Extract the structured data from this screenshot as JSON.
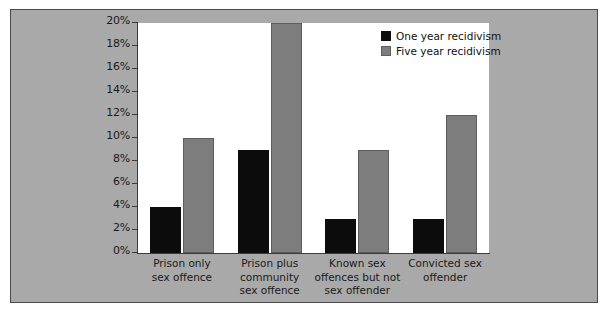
{
  "chart_data": {
    "type": "bar",
    "title": "",
    "xlabel": "",
    "ylabel": "",
    "ylim": [
      0,
      20
    ],
    "grid": false,
    "legend_position": "top-right-inside",
    "categories": [
      "Prison only\nsex offence",
      "Prison plus\ncommunity\nsex offence",
      "Known sex\noffences but not\nsex offender",
      "Convicted sex\noffender"
    ],
    "ytick_labels": [
      "0%",
      "2%",
      "4%",
      "6%",
      "8%",
      "10%",
      "12%",
      "14%",
      "16%",
      "18%",
      "20%"
    ],
    "ytick_values": [
      0,
      2,
      4,
      6,
      8,
      10,
      12,
      14,
      16,
      18,
      20
    ],
    "series": [
      {
        "name": "One year recidivism",
        "color": "#0c0c0c",
        "values": [
          4,
          9,
          3,
          3
        ]
      },
      {
        "name": "Five year recidivism",
        "color": "#7d7d7d",
        "values": [
          10,
          20,
          9,
          12
        ]
      }
    ]
  },
  "legend": {
    "items": [
      {
        "label": "One year recidivism",
        "swatch": "one-year"
      },
      {
        "label": "Five year recidivism",
        "swatch": "five-year"
      }
    ]
  },
  "colors": {
    "panel_background": "#a9a9a9",
    "plot_background": "#ffffff",
    "axis": "#3b3b3b",
    "one_year_bar": "#0c0c0c",
    "five_year_bar": "#7d7d7d"
  }
}
